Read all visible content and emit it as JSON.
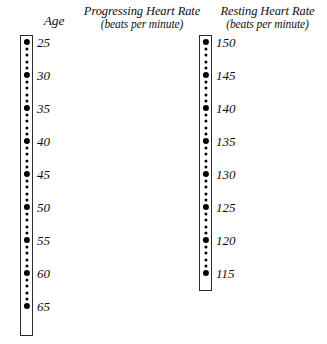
{
  "chart_data": {
    "type": "table",
    "layout": "three parallel vertical nomogram scales with dotted tick marks",
    "grid": false,
    "legend": "none",
    "scales": [
      {
        "name": "age",
        "title": "Age",
        "subtitle": "",
        "units": "",
        "direction": "descending-downward",
        "axis_range": [
          25,
          65
        ],
        "major_step": 5,
        "minor_divisions_per_major": 5,
        "major_ticks": [
          25,
          30,
          35,
          40,
          45,
          50,
          55,
          60,
          65
        ],
        "labels": [
          "25",
          "30",
          "35",
          "40",
          "45",
          "50",
          "55",
          "60",
          "65"
        ],
        "bar": {
          "x": 20,
          "y": 35,
          "width": 13,
          "height": 301
        },
        "major_spacing_px": 33,
        "terminal_minor_label": null
      },
      {
        "name": "progressing-heart-rate",
        "title": "Progressing Heart Rate",
        "subtitle": "(beats per minute)",
        "units": "beats per minute",
        "direction": "descending-downward",
        "axis_range": [
          115,
          150
        ],
        "major_step": 5,
        "minor_divisions_per_major": 5,
        "major_ticks": [
          150,
          145,
          140,
          135,
          130,
          125,
          120,
          115
        ],
        "labels": [
          "150",
          "145",
          "140",
          "135",
          "130",
          "125",
          "120",
          "115"
        ],
        "bar": {
          "x": 123,
          "y": 35,
          "width": 13,
          "height": 256
        },
        "major_spacing_px": 33,
        "terminal_minor_label": null
      },
      {
        "name": "resting-heart-rate",
        "title": "Resting Heart Rate",
        "subtitle": "(beats per minute)",
        "units": "beats per minute",
        "direction": "descending-downward",
        "axis_range": [
          72,
          95
        ],
        "major_step": 5,
        "minor_divisions_per_major": 5,
        "major_ticks": [
          95,
          90,
          85,
          80,
          75
        ],
        "labels": [
          "95",
          "90",
          "85",
          "80",
          "75"
        ],
        "bar": {
          "x": 250,
          "y": 35,
          "width": 13,
          "height": 177
        },
        "major_spacing_px": 33,
        "terminal_minor_label": "72",
        "terminal_minor_offset": 3
      }
    ],
    "colors": {
      "tick": "#000000",
      "bar_border": "#2b2b2b",
      "bar_fill": "#ffffff",
      "text": "#0d0d0d",
      "background": "#ffffff"
    }
  }
}
